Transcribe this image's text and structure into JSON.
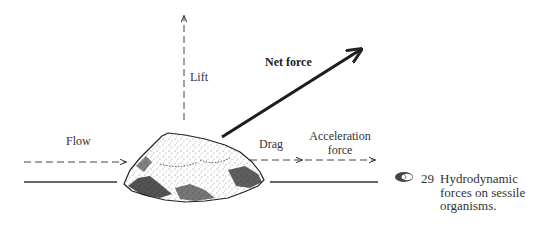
{
  "diagram": {
    "title": "Hydrodynamic forces on sessile organisms",
    "labels": {
      "lift": "Lift",
      "net_force": "Net force",
      "flow": "Flow",
      "drag": "Drag",
      "acceleration_line1": "Acceleration",
      "acceleration_line2": "force"
    },
    "caption": {
      "icon": "shell-icon",
      "number": "29",
      "line1": "Hydrodynamic",
      "line2": "forces on sessile",
      "line3": "organisms."
    },
    "colors": {
      "ink": "#222222",
      "background": "#ffffff"
    }
  }
}
